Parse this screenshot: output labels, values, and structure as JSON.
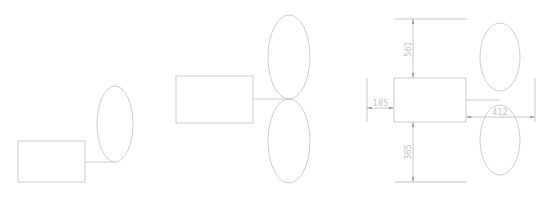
{
  "diagram": {
    "title": "",
    "colors": {
      "stroke": "#c8c8c8",
      "dimension": "#b8b8b8",
      "text": "#c4c4c4",
      "background": "#ffffff"
    },
    "panels": [
      {
        "id": "panel-1",
        "description": "Rectangle connected to a single ellipse",
        "rect": {
          "x": 18,
          "y": 141,
          "w": 67,
          "h": 41
        },
        "ellipses": [
          {
            "cx": 115,
            "cy": 124,
            "rx": 18,
            "ry": 38
          }
        ],
        "connector": {
          "x1": 85,
          "y1": 162,
          "x2": 115,
          "y2": 162
        }
      },
      {
        "id": "panel-2",
        "description": "Rectangle connected to the tangent point of two stacked ellipses",
        "rect": {
          "x": 176,
          "y": 76,
          "w": 77,
          "h": 47
        },
        "ellipses": [
          {
            "cx": 289,
            "cy": 57,
            "rx": 21,
            "ry": 42
          },
          {
            "cx": 289,
            "cy": 141,
            "rx": 21,
            "ry": 42
          }
        ],
        "connector": {
          "x1": 253,
          "y1": 99,
          "x2": 289,
          "y2": 99
        }
      },
      {
        "id": "panel-3",
        "description": "Dimensioned rectangle with two stacked ellipses",
        "rect": {
          "x": 394,
          "y": 78,
          "w": 72,
          "h": 44
        },
        "ellipses": [
          {
            "cx": 500,
            "cy": 57,
            "rx": 20,
            "ry": 34
          },
          {
            "cx": 500,
            "cy": 140,
            "rx": 20,
            "ry": 35
          }
        ],
        "connector": {
          "x1": 466,
          "y1": 100,
          "x2": 500,
          "y2": 100
        },
        "dimensions": {
          "top": {
            "label": "561",
            "value": 561
          },
          "bottom": {
            "label": "365",
            "value": 365
          },
          "left": {
            "label": "185",
            "value": 185
          },
          "right": {
            "label": "412",
            "value": 412
          }
        }
      }
    ]
  }
}
